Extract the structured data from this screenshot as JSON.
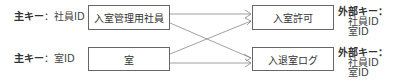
{
  "primary_keys": [
    {
      "label": "主キー",
      "sep": "：",
      "value": "社員ID"
    },
    {
      "label": "主キー",
      "sep": "：",
      "value": "室ID"
    }
  ],
  "entities_left": [
    {
      "name": "入室管理用社員"
    },
    {
      "name": "室"
    }
  ],
  "entities_right": [
    {
      "name": "入室許可"
    },
    {
      "name": "入退室ログ"
    }
  ],
  "foreign_keys": [
    {
      "label": "外部キー：",
      "items": [
        "社員ID",
        "室ID"
      ]
    },
    {
      "label": "外部キー：",
      "items": [
        "社員ID",
        "室ID"
      ]
    }
  ],
  "colors": {
    "line": "#888888",
    "border": "#666666"
  }
}
